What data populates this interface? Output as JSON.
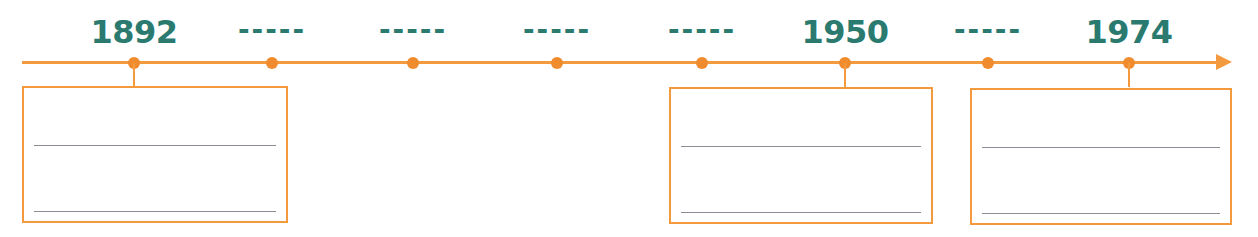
{
  "timeline": {
    "line_color": "#f39a3f",
    "label_color": "#2a7a70",
    "points": [
      {
        "label": "1892",
        "x": 134,
        "blank": false
      },
      {
        "label": "-----",
        "x": 272,
        "blank": true
      },
      {
        "label": "-----",
        "x": 413,
        "blank": true
      },
      {
        "label": "-----",
        "x": 557,
        "blank": true
      },
      {
        "label": "-----",
        "x": 702,
        "blank": true
      },
      {
        "label": "1950",
        "x": 845,
        "blank": false
      },
      {
        "label": "-----",
        "x": 988,
        "blank": true
      },
      {
        "label": "1974",
        "x": 1129,
        "blank": false
      }
    ]
  },
  "boxes": [
    {
      "for": "1892",
      "line1": "",
      "line2": ""
    },
    {
      "for": "1950",
      "line1": "",
      "line2": ""
    },
    {
      "for": "1974",
      "line1": "",
      "line2": ""
    }
  ]
}
